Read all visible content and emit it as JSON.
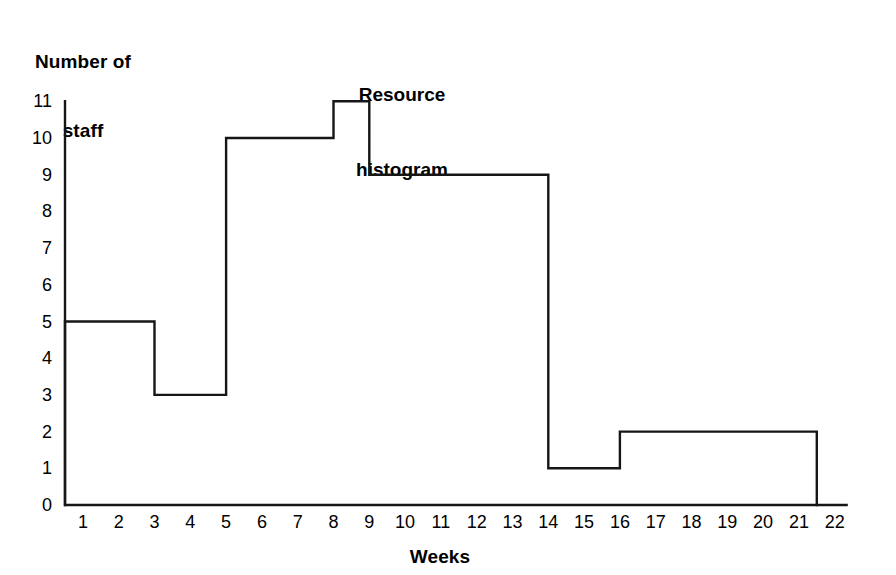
{
  "chart_data": {
    "type": "bar",
    "title": "Resource histogram",
    "title_lines": [
      "Resource",
      "histogram"
    ],
    "xlabel": "Weeks",
    "ylabel": "Number of staff",
    "ylabel_lines": [
      "Number of",
      "staff"
    ],
    "xlim": [
      0,
      22
    ],
    "ylim": [
      0,
      11
    ],
    "grid": false,
    "legend": null,
    "x_tick_labels": [
      "1",
      "2",
      "3",
      "4",
      "5",
      "6",
      "7",
      "8",
      "9",
      "10",
      "11",
      "12",
      "13",
      "14",
      "15",
      "16",
      "17",
      "18",
      "19",
      "20",
      "21",
      "22"
    ],
    "x_tick_values": [
      1,
      2,
      3,
      4,
      5,
      6,
      7,
      8,
      9,
      10,
      11,
      12,
      13,
      14,
      15,
      16,
      17,
      18,
      19,
      20,
      21,
      22
    ],
    "y_tick_labels": [
      "0",
      "1",
      "2",
      "3",
      "4",
      "5",
      "6",
      "7",
      "8",
      "9",
      "10",
      "11"
    ],
    "y_tick_values": [
      0,
      1,
      2,
      3,
      4,
      5,
      6,
      7,
      8,
      9,
      10,
      11
    ],
    "bars": [
      {
        "label": "Weeks 0-2.5",
        "x_start": 0.0,
        "x_end": 2.5,
        "value": 5
      },
      {
        "label": "Weeks 2.5-4.5",
        "x_start": 2.5,
        "x_end": 4.5,
        "value": 3
      },
      {
        "label": "Weeks 4.5-7.5",
        "x_start": 4.5,
        "x_end": 7.5,
        "value": 10
      },
      {
        "label": "Weeks 7.5-8.5",
        "x_start": 7.5,
        "x_end": 8.5,
        "value": 11
      },
      {
        "label": "Weeks 8.5-13.5",
        "x_start": 8.5,
        "x_end": 13.5,
        "value": 9
      },
      {
        "label": "Weeks 13.5-15.5",
        "x_start": 13.5,
        "x_end": 15.5,
        "value": 1
      },
      {
        "label": "Weeks 15.5-21.0",
        "x_start": 15.5,
        "x_end": 21.0,
        "value": 2
      }
    ],
    "categories": [
      "0-2.5",
      "2.5-4.5",
      "4.5-7.5",
      "7.5-8.5",
      "8.5-13.5",
      "13.5-15.5",
      "15.5-21"
    ],
    "values": [
      5,
      3,
      10,
      11,
      9,
      1,
      2
    ],
    "colors": {
      "stroke": "#161616",
      "fill": "#ffffff",
      "background": "#ffffff",
      "text": "#000000"
    }
  }
}
